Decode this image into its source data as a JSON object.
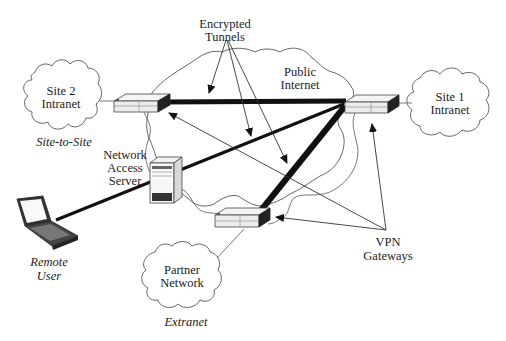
{
  "diagram": {
    "labels": {
      "encrypted_tunnels_line1": "Encrypted",
      "encrypted_tunnels_line2": "Tunnels",
      "public_internet_line1": "Public",
      "public_internet_line2": "Internet",
      "site2_line1": "Site 2",
      "site2_line2": "Intranet",
      "site_to_site": "Site-to-Site",
      "site1_line1": "Site 1",
      "site1_line2": "Intranet",
      "nas_line1": "Network",
      "nas_line2": "Access",
      "nas_line3": "Server",
      "remote_line1": "Remote",
      "remote_line2": "User",
      "partner_line1": "Partner",
      "partner_line2": "Network",
      "extranet": "Extranet",
      "vpn_line1": "VPN",
      "vpn_line2": "Gateways"
    },
    "nodes": [
      {
        "id": "site2-intranet",
        "type": "cloud",
        "label": "Site 2 Intranet"
      },
      {
        "id": "site1-intranet",
        "type": "cloud",
        "label": "Site 1 Intranet"
      },
      {
        "id": "public-internet",
        "type": "cloud",
        "label": "Public Internet"
      },
      {
        "id": "partner-network",
        "type": "cloud",
        "label": "Partner Network"
      },
      {
        "id": "site2-gateway",
        "type": "vpn-gateway"
      },
      {
        "id": "site1-gateway",
        "type": "vpn-gateway"
      },
      {
        "id": "partner-gateway",
        "type": "vpn-gateway"
      },
      {
        "id": "network-access-server",
        "type": "server",
        "label": "Network Access Server"
      },
      {
        "id": "remote-user-laptop",
        "type": "laptop",
        "label": "Remote User"
      }
    ],
    "edges": [
      {
        "from": "site2-gateway",
        "to": "site1-gateway",
        "type": "encrypted-tunnel",
        "category": "Site-to-Site"
      },
      {
        "from": "site1-gateway",
        "to": "partner-gateway",
        "type": "encrypted-tunnel",
        "category": "Extranet"
      },
      {
        "from": "site1-gateway",
        "to": "remote-user-laptop",
        "type": "encrypted-tunnel",
        "category": "Remote User"
      },
      {
        "from": "site2-intranet",
        "to": "site2-gateway",
        "type": "link"
      },
      {
        "from": "site1-gateway",
        "to": "site1-intranet",
        "type": "link"
      },
      {
        "from": "partner-gateway",
        "to": "partner-network",
        "type": "link"
      },
      {
        "from": "network-access-server",
        "to": "partner-gateway",
        "type": "link"
      }
    ],
    "colors": {
      "line": "#111111",
      "outline": "#555555",
      "background": "#ffffff"
    }
  }
}
